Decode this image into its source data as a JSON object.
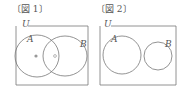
{
  "figures": [
    {
      "title": "〔図 1〕",
      "universe_label": "U",
      "set_a_label": "A",
      "set_b_label": "B",
      "description": "Overlapping sets A and B; filled dot in A only, hollow dot in A∩B"
    },
    {
      "title": "〔図 2〕",
      "universe_label": "U",
      "set_a_label": "A",
      "set_b_label": "B",
      "description": "Disjoint sets A and B"
    }
  ]
}
